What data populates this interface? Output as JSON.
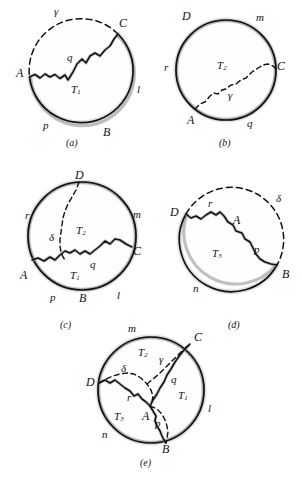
{
  "figure": {
    "panels": [
      {
        "id": "a",
        "caption": "(a)",
        "region_labels": [
          {
            "name": "T1",
            "text": "T",
            "sub": "1"
          }
        ],
        "labels": [
          {
            "name": "gamma",
            "text": "γ"
          },
          {
            "name": "C",
            "text": "C"
          },
          {
            "name": "A",
            "text": "A"
          },
          {
            "name": "q",
            "text": "q"
          },
          {
            "name": "l",
            "text": "l"
          },
          {
            "name": "p",
            "text": "p"
          },
          {
            "name": "B",
            "text": "B"
          }
        ]
      },
      {
        "id": "b",
        "caption": "(b)",
        "region_labels": [
          {
            "name": "T2",
            "text": "T",
            "sub": "2"
          }
        ],
        "labels": [
          {
            "name": "D",
            "text": "D"
          },
          {
            "name": "m",
            "text": "m"
          },
          {
            "name": "r",
            "text": "r"
          },
          {
            "name": "C",
            "text": "C"
          },
          {
            "name": "gamma",
            "text": "γ"
          },
          {
            "name": "A",
            "text": "A"
          },
          {
            "name": "q",
            "text": "q"
          }
        ]
      },
      {
        "id": "c",
        "caption": "(c)",
        "region_labels": [
          {
            "name": "T2",
            "text": "T",
            "sub": "2"
          },
          {
            "name": "T1",
            "text": "T",
            "sub": "1"
          }
        ],
        "labels": [
          {
            "name": "D",
            "text": "D"
          },
          {
            "name": "r",
            "text": "r"
          },
          {
            "name": "m",
            "text": "m"
          },
          {
            "name": "delta",
            "text": "δ"
          },
          {
            "name": "C",
            "text": "C"
          },
          {
            "name": "q",
            "text": "q"
          },
          {
            "name": "A",
            "text": "A"
          },
          {
            "name": "p",
            "text": "p"
          },
          {
            "name": "l",
            "text": "l"
          },
          {
            "name": "B",
            "text": "B"
          }
        ]
      },
      {
        "id": "d",
        "caption": "(d)",
        "region_labels": [
          {
            "name": "T3",
            "text": "T",
            "sub": "3"
          }
        ],
        "labels": [
          {
            "name": "delta",
            "text": "δ"
          },
          {
            "name": "D",
            "text": "D"
          },
          {
            "name": "r",
            "text": "r"
          },
          {
            "name": "A",
            "text": "A"
          },
          {
            "name": "p",
            "text": "p"
          },
          {
            "name": "n",
            "text": "n"
          },
          {
            "name": "B",
            "text": "B"
          }
        ]
      },
      {
        "id": "e",
        "caption": "(e)",
        "region_labels": [
          {
            "name": "T2",
            "text": "T",
            "sub": "2"
          },
          {
            "name": "T1",
            "text": "T",
            "sub": "1"
          },
          {
            "name": "T3",
            "text": "T",
            "sub": "3"
          }
        ],
        "labels": [
          {
            "name": "m",
            "text": "m"
          },
          {
            "name": "C",
            "text": "C"
          },
          {
            "name": "gamma",
            "text": "γ"
          },
          {
            "name": "delta",
            "text": "δ"
          },
          {
            "name": "D",
            "text": "D"
          },
          {
            "name": "q",
            "text": "q"
          },
          {
            "name": "r",
            "text": "r"
          },
          {
            "name": "l",
            "text": "l"
          },
          {
            "name": "A",
            "text": "A"
          },
          {
            "name": "p",
            "text": "p"
          },
          {
            "name": "n",
            "text": "n"
          },
          {
            "name": "B",
            "text": "B"
          }
        ]
      }
    ]
  },
  "colors": {
    "ink": "#111111",
    "shading": "#8d8d8d",
    "background": "#ffffff"
  }
}
